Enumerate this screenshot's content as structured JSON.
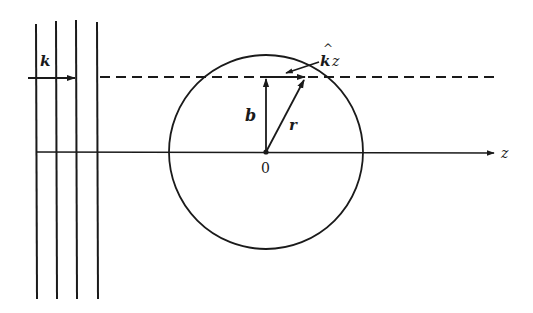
{
  "figure": {
    "type": "scattering geometry diagram",
    "labels": {
      "wave_vector": "k",
      "kz_hat": "^",
      "kz_k": "k",
      "kz_z": "z",
      "impact_parameter": "b",
      "position": "r",
      "origin": "0",
      "axis": "z"
    },
    "colors": {
      "ink": "#1a1a1a",
      "background": "#ffffff"
    },
    "geometry": {
      "wavefront_lines_x": [
        36,
        56,
        77,
        98
      ],
      "wavefront_top_y": 22,
      "wavefront_bottom_y": 299,
      "axis_y": 152,
      "dashed_line_y": 77,
      "circle_center": [
        266,
        152
      ],
      "circle_radius": 97,
      "r_vector_tip": [
        306,
        77
      ]
    }
  }
}
